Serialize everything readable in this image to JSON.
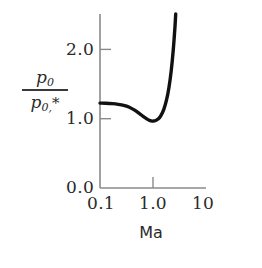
{
  "chart_data": {
    "type": "line",
    "title": "",
    "xlabel": "Ma",
    "ylabel_numerator": "p0",
    "ylabel_denominator": "p0,*",
    "xscale": "log",
    "yscale": "linear",
    "xlim": [
      0.1,
      10
    ],
    "ylim": [
      0.0,
      2.6
    ],
    "grid": false,
    "legend": null,
    "xticks": [
      0.1,
      1.0,
      10
    ],
    "xtick_labels": [
      "0.1",
      "1.0",
      "10"
    ],
    "yticks": [
      0.0,
      1.0,
      2.0
    ],
    "ytick_labels": [
      "0.0",
      "1.0",
      "2.0"
    ],
    "series": [
      {
        "name": "stagnation pressure ratio",
        "color": "#111111",
        "x": [
          0.1,
          0.13,
          0.17,
          0.22,
          0.28,
          0.35,
          0.45,
          0.55,
          0.65,
          0.75,
          0.85,
          0.92,
          1.0,
          1.1,
          1.25,
          1.4,
          1.6,
          1.8,
          2.0,
          2.2,
          2.4,
          2.6,
          2.8,
          2.95
        ],
        "y": [
          1.268,
          1.266,
          1.26,
          1.25,
          1.235,
          1.21,
          1.163,
          1.114,
          1.071,
          1.037,
          1.012,
          1.003,
          1.0,
          1.005,
          1.03,
          1.078,
          1.176,
          1.316,
          1.503,
          1.743,
          2.045,
          2.413,
          2.862,
          3.22
        ]
      }
    ]
  },
  "axis": {
    "x_title": "Ma",
    "y_numerator": "p",
    "y_numerator_sub": "0",
    "y_denominator": "p",
    "y_denominator_sub": "0,",
    "y_denominator_star": "*"
  },
  "colors": {
    "curve": "#111111",
    "axis": "#8a8a8a",
    "text": "#2a2a2a",
    "background": "#ffffff"
  }
}
